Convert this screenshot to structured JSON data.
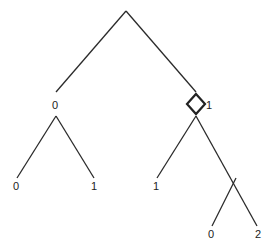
{
  "tree": {
    "root_to_left_label": "0",
    "root_to_right_label": "1",
    "left_leaf_left": "0",
    "left_leaf_right": "1",
    "right_leaf_left": "1",
    "right_inner_leaf_left": "0",
    "right_inner_leaf_right": "2"
  },
  "marker": {
    "shape": "diamond",
    "node": "right child of root"
  }
}
